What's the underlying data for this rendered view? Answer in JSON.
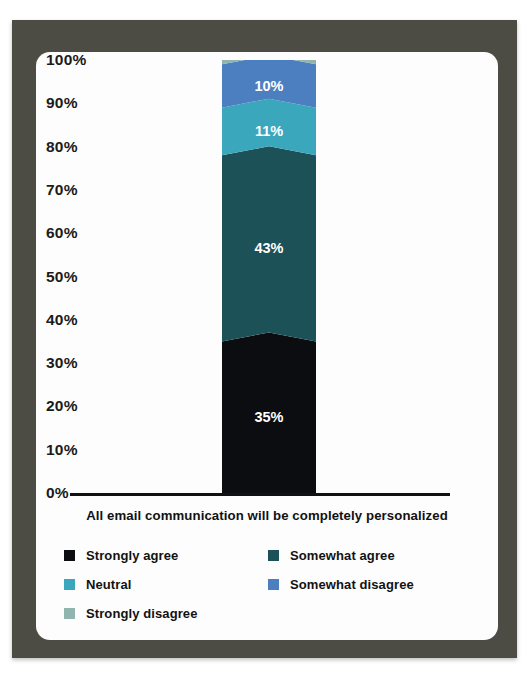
{
  "frame": {
    "border_color": "#4c4c45",
    "card_color": "#fdfdfd"
  },
  "chart_data": {
    "type": "bar",
    "stacked": true,
    "orientation": "vertical",
    "title": "All email communication will be completely personalized",
    "xlabel": "",
    "ylabel": "",
    "ylim": [
      0,
      100
    ],
    "grid": false,
    "legend_position": "bottom",
    "categories": [
      "All email communication will be completely personalized"
    ],
    "y_ticks": [
      "0%",
      "10%",
      "20%",
      "30%",
      "40%",
      "50%",
      "60%",
      "70%",
      "80%",
      "90%",
      "100%"
    ],
    "y_tick_values": [
      0,
      10,
      20,
      30,
      40,
      50,
      60,
      70,
      80,
      90,
      100
    ],
    "series": [
      {
        "name": "Strongly agree",
        "values": [
          35
        ],
        "label": "35%",
        "color": "#0b0d10",
        "show_label": true
      },
      {
        "name": "Somewhat agree",
        "values": [
          43
        ],
        "label": "43%",
        "color": "#1c5158",
        "show_label": true
      },
      {
        "name": "Neutral",
        "values": [
          11
        ],
        "label": "11%",
        "color": "#3ba7bd",
        "show_label": true
      },
      {
        "name": "Somewhat disagree",
        "values": [
          10
        ],
        "label": "10%",
        "color": "#4c7fc0",
        "show_label": true
      },
      {
        "name": "Strongly disagree",
        "values": [
          1
        ],
        "label": "",
        "color": "#8fb5ae",
        "show_label": false
      }
    ]
  },
  "legend": {
    "rows": [
      [
        {
          "label": "Strongly agree",
          "color": "#0b0d10"
        },
        {
          "label": "Somewhat agree",
          "color": "#1c5158"
        }
      ],
      [
        {
          "label": "Neutral",
          "color": "#3ba7bd"
        },
        {
          "label": "Somewhat disagree",
          "color": "#4c7fc0"
        }
      ],
      [
        {
          "label": "Strongly disagree",
          "color": "#8fb5ae"
        }
      ]
    ]
  }
}
